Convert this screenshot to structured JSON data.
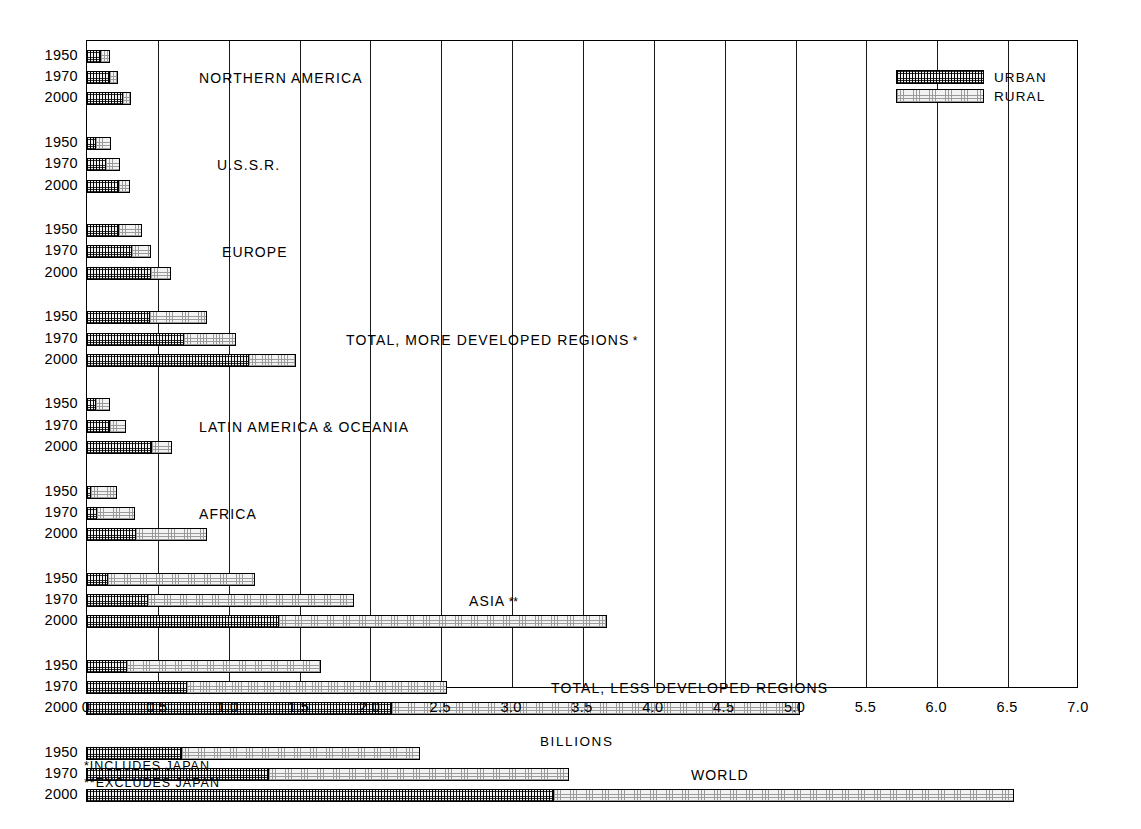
{
  "axis": {
    "title": "BILLIONS",
    "tick_labels": [
      "0",
      "0.5",
      "1.0",
      "1.5",
      "2.0",
      "2.5",
      "3.0",
      "3.5",
      "4.0",
      "4.5",
      "5.0",
      "5.5",
      "6.0",
      "6.5",
      "7.0"
    ],
    "tick_values": [
      0,
      0.5,
      1.0,
      1.5,
      2.0,
      2.5,
      3.0,
      3.5,
      4.0,
      4.5,
      5.0,
      5.5,
      6.0,
      6.5,
      7.0
    ],
    "xmin": 0,
    "xmax": 7.0
  },
  "legend": {
    "items": [
      {
        "label": "URBAN",
        "pattern": "urban"
      },
      {
        "label": "RURAL",
        "pattern": "rural"
      }
    ]
  },
  "footnotes": [
    "*INCLUDES JAPAN",
    "**EXCLUDES JAPAN"
  ],
  "years": [
    "1950",
    "1970",
    "2000"
  ],
  "groups": [
    {
      "label": "NORTHERN AMERICA",
      "footnote_mark": "",
      "label_x": 113,
      "rows": [
        {
          "year": "1950",
          "urban": 0.106,
          "rural": 0.066
        },
        {
          "year": "1970",
          "urban": 0.167,
          "rural": 0.059
        },
        {
          "year": "2000",
          "urban": 0.262,
          "rural": 0.057
        }
      ]
    },
    {
      "label": "U.S.S.R.",
      "footnote_mark": "",
      "label_x": 131,
      "rows": [
        {
          "year": "1950",
          "urban": 0.071,
          "rural": 0.109
        },
        {
          "year": "1970",
          "urban": 0.139,
          "rural": 0.104
        },
        {
          "year": "2000",
          "urban": 0.23,
          "rural": 0.078
        }
      ]
    },
    {
      "label": "EUROPE",
      "footnote_mark": "",
      "label_x": 136,
      "rows": [
        {
          "year": "1950",
          "urban": 0.233,
          "rural": 0.159
        },
        {
          "year": "1970",
          "urban": 0.322,
          "rural": 0.14
        },
        {
          "year": "2000",
          "urban": 0.462,
          "rural": 0.136
        }
      ]
    },
    {
      "label": "TOTAL, MORE DEVELOPED REGIONS",
      "footnote_mark": "*",
      "label_x": 260,
      "rows": [
        {
          "year": "1950",
          "urban": 0.449,
          "rural": 0.408
        },
        {
          "year": "1970",
          "urban": 0.695,
          "rural": 0.367
        },
        {
          "year": "2000",
          "urban": 1.148,
          "rural": 0.332
        }
      ]
    },
    {
      "label": "LATIN AMERICA & OCEANIA",
      "footnote_mark": "",
      "label_x": 113,
      "rows": [
        {
          "year": "1950",
          "urban": 0.072,
          "rural": 0.1
        },
        {
          "year": "1970",
          "urban": 0.168,
          "rural": 0.114
        },
        {
          "year": "2000",
          "urban": 0.465,
          "rural": 0.142
        }
      ]
    },
    {
      "label": "AFRICA",
      "footnote_mark": "",
      "label_x": 113,
      "rows": [
        {
          "year": "1950",
          "urban": 0.032,
          "rural": 0.188
        },
        {
          "year": "1970",
          "urban": 0.08,
          "rural": 0.264
        },
        {
          "year": "2000",
          "urban": 0.352,
          "rural": 0.5
        }
      ]
    },
    {
      "label": "ASIA",
      "footnote_mark": "**",
      "label_x": 383,
      "rows": [
        {
          "year": "1950",
          "urban": 0.153,
          "rural": 1.038
        },
        {
          "year": "1970",
          "urban": 0.44,
          "rural": 1.45
        },
        {
          "year": "2000",
          "urban": 1.36,
          "rural": 2.32
        }
      ]
    },
    {
      "label": "TOTAL, LESS DEVELOPED REGIONS",
      "footnote_mark": "",
      "label_x": 465,
      "rows": [
        {
          "year": "1950",
          "urban": 0.29,
          "rural": 1.37
        },
        {
          "year": "1970",
          "urban": 0.715,
          "rural": 1.83
        },
        {
          "year": "2000",
          "urban": 2.16,
          "rural": 2.88
        }
      ]
    },
    {
      "label": "WORLD",
      "footnote_mark": "",
      "label_x": 605,
      "rows": [
        {
          "year": "1950",
          "urban": 0.68,
          "rural": 1.68
        },
        {
          "year": "1970",
          "urban": 1.29,
          "rural": 2.12
        },
        {
          "year": "2000",
          "urban": 3.3,
          "rural": 3.25
        }
      ]
    }
  ],
  "chart_data": {
    "type": "bar",
    "title": "",
    "subtitle": "",
    "xlabel": "BILLIONS",
    "ylabel": "",
    "xlim": [
      0,
      7.0
    ],
    "orientation": "horizontal",
    "stacked": true,
    "grid": "vertical",
    "legend_position": "top-right",
    "categories": [
      "NORTHERN AMERICA 1950",
      "NORTHERN AMERICA 1970",
      "NORTHERN AMERICA 2000",
      "U.S.S.R. 1950",
      "U.S.S.R. 1970",
      "U.S.S.R. 2000",
      "EUROPE 1950",
      "EUROPE 1970",
      "EUROPE 2000",
      "TOTAL, MORE DEVELOPED REGIONS 1950",
      "TOTAL, MORE DEVELOPED REGIONS 1970",
      "TOTAL, MORE DEVELOPED REGIONS 2000",
      "LATIN AMERICA & OCEANIA 1950",
      "LATIN AMERICA & OCEANIA 1970",
      "LATIN AMERICA & OCEANIA 2000",
      "AFRICA 1950",
      "AFRICA 1970",
      "AFRICA 2000",
      "ASIA 1950",
      "ASIA 1970",
      "ASIA 2000",
      "TOTAL, LESS DEVELOPED REGIONS 1950",
      "TOTAL, LESS DEVELOPED REGIONS 1970",
      "TOTAL, LESS DEVELOPED REGIONS 2000",
      "WORLD 1950",
      "WORLD 1970",
      "WORLD 2000"
    ],
    "series": [
      {
        "name": "URBAN",
        "values": [
          0.106,
          0.167,
          0.262,
          0.071,
          0.139,
          0.23,
          0.233,
          0.322,
          0.462,
          0.449,
          0.695,
          1.148,
          0.072,
          0.168,
          0.465,
          0.032,
          0.08,
          0.352,
          0.153,
          0.44,
          1.36,
          0.29,
          0.715,
          2.16,
          0.68,
          1.29,
          3.3
        ]
      },
      {
        "name": "RURAL",
        "values": [
          0.066,
          0.059,
          0.057,
          0.109,
          0.104,
          0.078,
          0.159,
          0.14,
          0.136,
          0.408,
          0.367,
          0.332,
          0.1,
          0.114,
          0.142,
          0.188,
          0.264,
          0.5,
          1.038,
          1.45,
          2.32,
          1.37,
          1.83,
          2.88,
          1.68,
          2.12,
          3.25
        ]
      }
    ],
    "totals": [
      0.172,
      0.226,
      0.319,
      0.18,
      0.243,
      0.308,
      0.392,
      0.462,
      0.598,
      0.857,
      1.062,
      1.48,
      0.172,
      0.282,
      0.607,
      0.22,
      0.344,
      0.852,
      1.191,
      1.89,
      3.68,
      1.66,
      2.545,
      5.04,
      2.36,
      3.41,
      6.55
    ],
    "annotations": [
      "*INCLUDES JAPAN",
      "**EXCLUDES JAPAN"
    ]
  }
}
